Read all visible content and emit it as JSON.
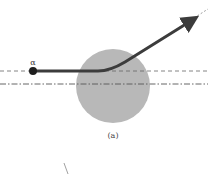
{
  "diagram": {
    "particle_label": "α",
    "caption": "(a)",
    "colors": {
      "nucleus": "#b8b8b8",
      "trajectory": "#3c3c3c",
      "particle": "#1e1e1e",
      "guide_lines": "#555555",
      "text": "#333333"
    }
  }
}
